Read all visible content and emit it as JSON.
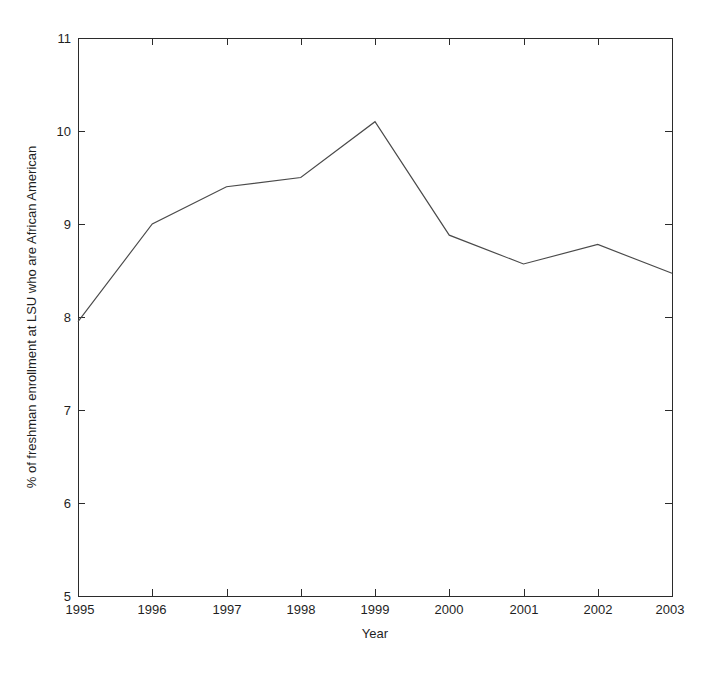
{
  "chart_data": {
    "type": "line",
    "title": "",
    "subtitle": "",
    "xlabel": "Year",
    "ylabel": "% of freshman enrollment at LSU who are African American",
    "x": [
      1995,
      1996,
      1997,
      1998,
      1999,
      2000,
      2001,
      2002,
      2003
    ],
    "categories": [
      "1995",
      "1996",
      "1997",
      "1998",
      "1999",
      "2000",
      "2001",
      "2002",
      "2003"
    ],
    "values": [
      7.95,
      9.0,
      9.4,
      9.5,
      10.1,
      8.88,
      8.57,
      8.78,
      8.47
    ],
    "series": [
      {
        "name": "% African American freshman enrollment",
        "values": [
          7.95,
          9.0,
          9.4,
          9.5,
          10.1,
          8.88,
          8.57,
          8.78,
          8.47
        ]
      }
    ],
    "xlim": [
      1995,
      2003
    ],
    "ylim": [
      5,
      11
    ],
    "xticks": [
      1995,
      1996,
      1997,
      1998,
      1999,
      2000,
      2001,
      2002,
      2003
    ],
    "yticks": [
      5,
      6,
      7,
      8,
      9,
      10,
      11
    ],
    "xtick_labels": [
      "1995",
      "1996",
      "1997",
      "1998",
      "1999",
      "2000",
      "2001",
      "2002",
      "2003"
    ],
    "ytick_labels": [
      "5",
      "6",
      "7",
      "8",
      "9",
      "10",
      "11"
    ],
    "grid": false,
    "legend": false,
    "legend_position": "none",
    "line_color": "#4a4a4a",
    "axis_color": "#2b2b2b",
    "background_color": "#ffffff",
    "annotations": []
  }
}
